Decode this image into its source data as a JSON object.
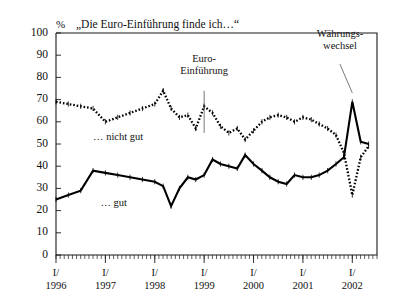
{
  "chart_data": {
    "type": "line",
    "title": "„Die Euro-Einführung finde ich…“",
    "unit_label": "%",
    "xlabel": "",
    "ylabel": "",
    "ylim": [
      0,
      100
    ],
    "ytick_step": 10,
    "yticks": [
      "0",
      "10",
      "20",
      "30",
      "40",
      "50",
      "60",
      "70",
      "80",
      "90",
      "100"
    ],
    "xlim_years": [
      1996,
      2002.5
    ],
    "xtick_labels": [
      {
        "top": "I/",
        "bottom": "1996"
      },
      {
        "top": "I/",
        "bottom": "1997"
      },
      {
        "top": "I/",
        "bottom": "1998"
      },
      {
        "top": "I/",
        "bottom": "1999"
      },
      {
        "top": "I/",
        "bottom": "2000"
      },
      {
        "top": "I/",
        "bottom": "2001"
      },
      {
        "top": "I/",
        "bottom": "2002"
      }
    ],
    "minor_ticks_per_year": 12,
    "grid": false,
    "legend_position": "inline-annotations",
    "series": [
      {
        "name": "… nicht gut",
        "style": "dotted",
        "label_x_year": 1996.75,
        "label_y_value": 52,
        "x": [
          1996.0,
          1996.25,
          1996.5,
          1996.75,
          1997.0,
          1997.25,
          1997.5,
          1997.75,
          1998.0,
          1998.17,
          1998.33,
          1998.5,
          1998.67,
          1998.83,
          1999.0,
          1999.17,
          1999.33,
          1999.5,
          1999.67,
          1999.83,
          2000.0,
          2000.17,
          2000.33,
          2000.5,
          2000.67,
          2000.83,
          2001.0,
          2001.17,
          2001.33,
          2001.5,
          2001.67,
          2001.83,
          2002.0,
          2002.17,
          2002.33
        ],
        "values": [
          69,
          68,
          67,
          66,
          60,
          62,
          64,
          66,
          68,
          74,
          66,
          62,
          63,
          57,
          67,
          64,
          58,
          55,
          57,
          52,
          56,
          60,
          62,
          63,
          62,
          60,
          62,
          61,
          59,
          57,
          54,
          46,
          27,
          44,
          49
        ]
      },
      {
        "name": "… gut",
        "style": "solid",
        "label_x_year": 1996.9,
        "label_y_value": 22,
        "x": [
          1996.0,
          1996.25,
          1996.5,
          1996.75,
          1997.0,
          1997.25,
          1997.5,
          1997.75,
          1998.0,
          1998.17,
          1998.33,
          1998.5,
          1998.67,
          1998.83,
          1999.0,
          1999.17,
          1999.33,
          1999.5,
          1999.67,
          1999.83,
          2000.0,
          2000.17,
          2000.33,
          2000.5,
          2000.67,
          2000.83,
          2001.0,
          2001.17,
          2001.33,
          2001.5,
          2001.67,
          2001.83,
          2002.0,
          2002.17,
          2002.33
        ],
        "values": [
          25,
          27,
          29,
          38,
          37,
          36,
          35,
          34,
          33,
          31,
          22,
          30,
          35,
          34,
          36,
          43,
          41,
          40,
          39,
          45,
          41,
          38,
          35,
          33,
          32,
          36,
          35,
          35,
          36,
          38,
          41,
          44,
          69,
          51,
          50
        ]
      }
    ],
    "annotations": [
      {
        "text_lines": [
          "Euro-",
          "Einführung"
        ],
        "anchor_x_year": 1999.0,
        "text_x_year": 1999.0,
        "text_y_value": 87,
        "leader_from_value": 74,
        "leader_to_value": 55
      },
      {
        "text_lines": [
          "Währungs-",
          "wechsel"
        ],
        "anchor_x_year": 2002.0,
        "text_x_year": 2001.75,
        "text_y_value": 98,
        "leader_from_value": 86,
        "leader_to_value": 73
      }
    ]
  }
}
